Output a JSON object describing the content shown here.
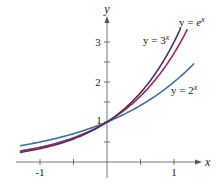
{
  "chart_data": {
    "type": "line",
    "title": "",
    "xlabel": "x",
    "ylabel": "y",
    "xlim": [
      -1.3,
      1.3
    ],
    "ylim": [
      0,
      3.4
    ],
    "grid": false,
    "x_ticks": [
      -1,
      1
    ],
    "x_tick_labels": [
      "-1",
      "1"
    ],
    "x_minor_ticks": [
      -0.5,
      0.5
    ],
    "y_ticks": [
      1,
      2,
      3
    ],
    "y_tick_labels": [
      "1",
      "2",
      "3"
    ],
    "y_minor_ticks": [
      0.5,
      1.5,
      2.5
    ],
    "series": [
      {
        "name": "y = 2^x",
        "label": "y = 2",
        "exp": "x",
        "base": 2,
        "color": "#3a6fa8",
        "x": [
          -1.3,
          -1,
          -0.5,
          0,
          0.5,
          1,
          1.3
        ],
        "y": [
          0.41,
          0.5,
          0.71,
          1,
          1.41,
          2,
          2.46
        ]
      },
      {
        "name": "y = e^x",
        "label": "y = e",
        "exp": "x",
        "base": 2.718,
        "color": "#9b2d4a",
        "x": [
          -1.3,
          -1,
          -0.5,
          0,
          0.5,
          1,
          1.2
        ],
        "y": [
          0.27,
          0.37,
          0.61,
          1,
          1.65,
          2.72,
          3.32
        ]
      },
      {
        "name": "y = 3^x",
        "label": "y = 3",
        "exp": "x",
        "base": 3,
        "color": "#4a3070",
        "x": [
          -1.3,
          -1,
          -0.5,
          0,
          0.5,
          1,
          1.1
        ],
        "y": [
          0.24,
          0.33,
          0.58,
          1,
          1.73,
          3,
          3.35
        ]
      }
    ]
  }
}
